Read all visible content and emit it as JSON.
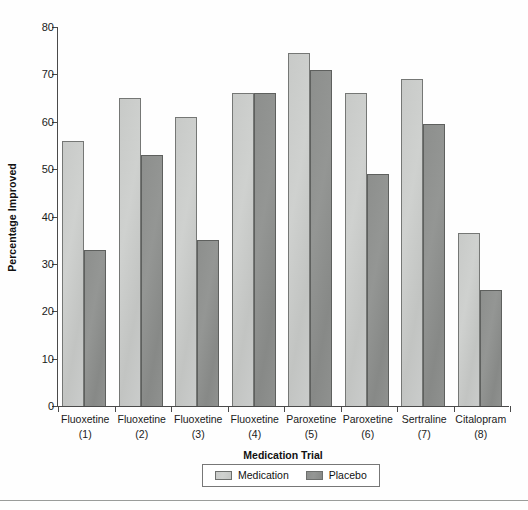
{
  "chart_data": {
    "type": "bar",
    "title": "",
    "xlabel": "Medication Trial",
    "ylabel": "Percentage Improved",
    "ylim": [
      0,
      80
    ],
    "yticks": [
      0,
      10,
      20,
      30,
      40,
      50,
      60,
      70,
      80
    ],
    "grid": false,
    "legend_position": "bottom-center",
    "categories": [
      "Fluoxetine (1)",
      "Fluoxetine (2)",
      "Fluoxetine (3)",
      "Fluoxetine (4)",
      "Paroxetine (5)",
      "Paroxetine (6)",
      "Sertraline (7)",
      "Citalopram (8)"
    ],
    "category_lines": [
      {
        "drug": "Fluoxetine",
        "number": "(1)"
      },
      {
        "drug": "Fluoxetine",
        "number": "(2)"
      },
      {
        "drug": "Fluoxetine",
        "number": "(3)"
      },
      {
        "drug": "Fluoxetine",
        "number": "(4)"
      },
      {
        "drug": "Paroxetine",
        "number": "(5)"
      },
      {
        "drug": "Paroxetine",
        "number": "(6)"
      },
      {
        "drug": "Sertraline",
        "number": "(7)"
      },
      {
        "drug": "Citalopram",
        "number": "(8)"
      }
    ],
    "series": [
      {
        "name": "Medication",
        "color": "#c8cac8",
        "values": [
          56,
          65,
          61,
          66,
          74.5,
          66,
          69,
          36.5
        ]
      },
      {
        "name": "Placebo",
        "color": "#8d8f8d",
        "values": [
          33,
          53,
          35,
          66,
          71,
          49,
          59.5,
          24.5
        ]
      }
    ]
  },
  "legend": {
    "items": [
      {
        "label": "Medication"
      },
      {
        "label": "Placebo"
      }
    ]
  },
  "axis": {
    "y_title": "Percentage Improved",
    "x_title": "Medication Trial",
    "y_tick_labels": [
      "0",
      "10",
      "20",
      "30",
      "40",
      "50",
      "60",
      "70",
      "80"
    ]
  }
}
